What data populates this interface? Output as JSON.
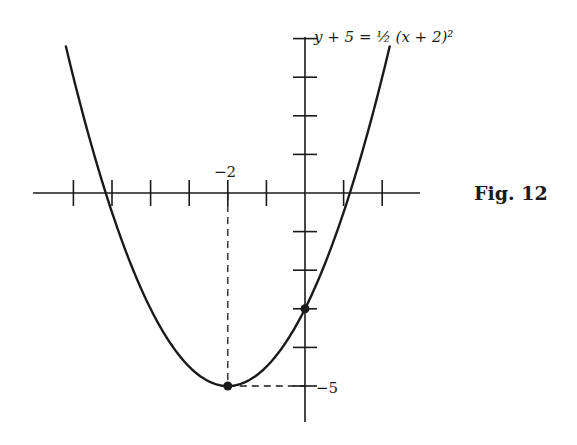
{
  "figure": {
    "label": "Fig. 12",
    "equation": "y + 5 = ½ (x + 2)²",
    "x_tick_label": "−2",
    "y_tick_label": "−5"
  },
  "colors": {
    "ink": "#1a1a1a",
    "background": "#ffffff"
  },
  "chart_data": {
    "type": "line",
    "title": "y + 5 = ½ (x + 2)²",
    "function": "y = 0.5*(x+2)^2 - 5",
    "xlim": [
      -7,
      3
    ],
    "ylim": [
      -6,
      4
    ],
    "x_ticks": [
      -6,
      -5,
      -4,
      -3,
      -2,
      -1,
      1,
      2
    ],
    "y_ticks": [
      4,
      3,
      2,
      1,
      -1,
      -2,
      -3,
      -4,
      -5
    ],
    "labeled_ticks": {
      "x": [
        -2
      ],
      "y": [
        -5
      ]
    },
    "points": [
      {
        "x": -2,
        "y": -5,
        "label": "vertex"
      },
      {
        "x": 0,
        "y": -3,
        "label": "y-intercept"
      }
    ],
    "guide_lines": [
      {
        "from": [
          -2,
          0
        ],
        "to": [
          -2,
          -5
        ],
        "style": "dashed"
      },
      {
        "from": [
          -2,
          -5
        ],
        "to": [
          0,
          -5
        ],
        "style": "dashed"
      }
    ],
    "curve_x_range": [
      -6.2,
      2.2
    ],
    "grid": false
  }
}
